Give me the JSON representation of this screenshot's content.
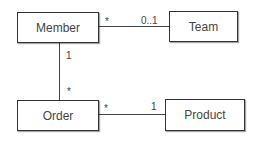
{
  "diagram": {
    "type": "UML class diagram",
    "classes": [
      {
        "id": "member",
        "label": "Member"
      },
      {
        "id": "team",
        "label": "Team"
      },
      {
        "id": "order",
        "label": "Order"
      },
      {
        "id": "product",
        "label": "Product"
      }
    ],
    "associations": [
      {
        "from": "member",
        "to": "team",
        "from_mult": "*",
        "to_mult": "0..1"
      },
      {
        "from": "member",
        "to": "order",
        "from_mult": "1",
        "to_mult": "*"
      },
      {
        "from": "order",
        "to": "product",
        "from_mult": "*",
        "to_mult": "1"
      }
    ]
  }
}
